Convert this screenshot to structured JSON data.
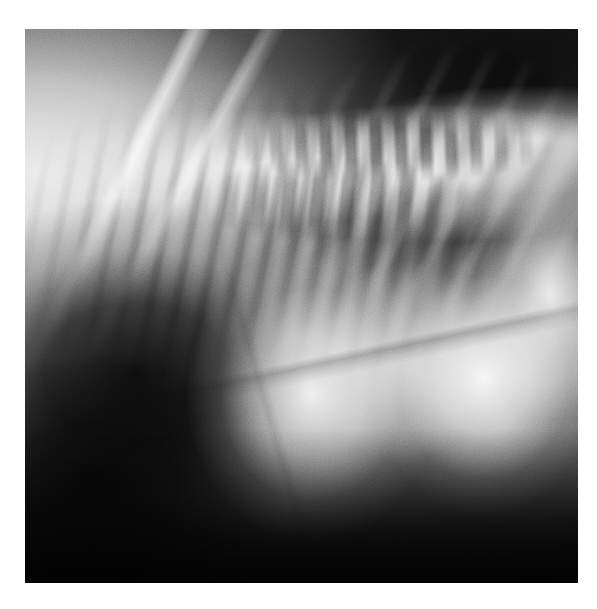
{
  "viewer": {
    "width": 597,
    "height": 609,
    "background_color": "#ffffff",
    "alt_text": "Lateral radiograph of a small animal thorax and cranial abdomen"
  },
  "film": {
    "x": 25,
    "y": 29,
    "width": 553,
    "height": 554,
    "modality": "X-ray radiograph",
    "view": "lateral projection",
    "grayscale_range": [
      "#000000",
      "#ffffff"
    ],
    "has_burned_in_text": false,
    "has_annotation_markers": false
  },
  "anatomy": [
    {
      "id": "background-air",
      "label": "Air / background outside patient",
      "density": "radiolucent",
      "tone": "#111111",
      "region": "upper right, upper centre"
    },
    {
      "id": "scapula-streaks",
      "label": "Scapular margins (bright oblique lines)",
      "density": "radiopaque",
      "tone": "#f2f2f2",
      "region": "upper left"
    },
    {
      "id": "thoracic-spine",
      "label": "Thoracic vertebral column",
      "density": "radiopaque",
      "tone": "#e8e8e8",
      "region": "upper centre to upper right"
    },
    {
      "id": "spinous-processes",
      "label": "Dorsal spinous processes",
      "density": "radiopaque",
      "tone": "#dcdcdc",
      "region": "top right arc"
    },
    {
      "id": "rib-cage",
      "label": "Rib striations",
      "density": "radiopaque",
      "tone": "#c8c8c8",
      "region": "mid-left through centre"
    },
    {
      "id": "lung-gas-field",
      "label": "Gas-filled lucent field",
      "density": "radiolucent",
      "tone": "#0d0d0d",
      "region": "lower left"
    },
    {
      "id": "abdominal-mass-central",
      "label": "Bright soft-tissue mass (central)",
      "density": "soft tissue",
      "tone": "#f6f6f6",
      "region": "centre"
    },
    {
      "id": "abdominal-mass-right",
      "label": "Bright soft-tissue mass (right)",
      "density": "soft tissue",
      "tone": "#fafafa",
      "region": "right of centre"
    },
    {
      "id": "ventral-floor",
      "label": "Ventral body wall shadow",
      "density": "mixed",
      "tone": "#1a1a1a",
      "region": "bottom band"
    }
  ]
}
